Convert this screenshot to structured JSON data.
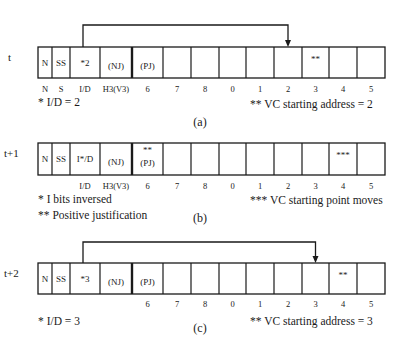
{
  "panels": [
    {
      "id": "a",
      "time_label": "t",
      "caption": "(a)",
      "cells": [
        "N",
        "SS",
        "*2",
        "(NJ)",
        "(PJ)",
        "",
        "",
        "",
        "",
        "",
        "**",
        "",
        "",
        ""
      ],
      "cell_top_marks": [
        "",
        "",
        "",
        "",
        "",
        "",
        "",
        "",
        "",
        "",
        "",
        "",
        "",
        ""
      ],
      "column_labels": [
        "N",
        "S",
        "I/D",
        "H3(V3)",
        "6",
        "7",
        "8",
        "0",
        "1",
        "2",
        "3",
        "4",
        "5"
      ],
      "pointer": {
        "from_cell": 2,
        "to_cell": 10
      },
      "notes_left": [
        "*  I/D = 2"
      ],
      "notes_right": [
        "** VC starting address = 2"
      ]
    },
    {
      "id": "b",
      "time_label": "t+1",
      "caption": "(b)",
      "cells": [
        "N",
        "SS",
        "I*/D",
        "(NJ)",
        "(PJ)",
        "",
        "",
        "",
        "",
        "",
        "",
        "***",
        "",
        ""
      ],
      "cell_top_marks": [
        "",
        "",
        "",
        "",
        "**",
        "",
        "",
        "",
        "",
        "",
        "",
        "",
        "",
        ""
      ],
      "column_labels": [
        "",
        "",
        "I/D",
        "H3(V3)",
        "6",
        "7",
        "8",
        "0",
        "1",
        "2",
        "3",
        "4",
        "5"
      ],
      "pointer": null,
      "notes_left": [
        "*  I bits  inversed",
        "** Positive justification"
      ],
      "notes_right": [
        "*** VC starting point moves"
      ]
    },
    {
      "id": "c",
      "time_label": "t+2",
      "caption": "(c)",
      "cells": [
        "N",
        "SS",
        "*3",
        "(NJ)",
        "(PJ)",
        "",
        "",
        "",
        "",
        "",
        "",
        "**",
        "",
        ""
      ],
      "cell_top_marks": [
        "",
        "",
        "",
        "",
        "",
        "",
        "",
        "",
        "",
        "",
        "",
        "",
        "",
        ""
      ],
      "column_labels": [
        "",
        "",
        "",
        "",
        "6",
        "7",
        "8",
        "0",
        "1",
        "2",
        "3",
        "4",
        "5"
      ],
      "pointer": {
        "from_cell": 2,
        "to_cell": 11
      },
      "notes_left": [
        "*  I/D = 3"
      ],
      "notes_right": [
        "** VC starting address = 3"
      ]
    }
  ]
}
